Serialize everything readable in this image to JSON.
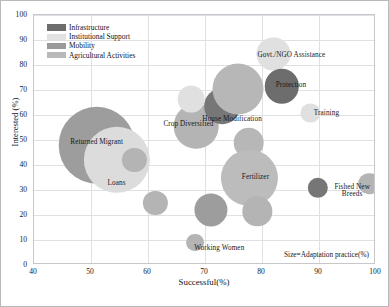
{
  "chart_data": {
    "type": "scatter",
    "title": "",
    "xlabel": "Successful(%)",
    "ylabel": "Interested (%)",
    "xlim": [
      40,
      100
    ],
    "ylim": [
      0,
      100
    ],
    "xticks": [
      40,
      50,
      60,
      70,
      80,
      90,
      100
    ],
    "yticks": [
      0,
      10,
      20,
      30,
      40,
      50,
      60,
      70,
      80,
      90,
      100
    ],
    "grid": true,
    "legend_position": "top-left",
    "size_note": "Size=Adaptation practice(%)",
    "size_encoding": "Size=Adaptation practice(%)",
    "legend": [
      {
        "label": "Infrastructure",
        "color": "#6d6d6d"
      },
      {
        "label": "Institutional Support",
        "color": "#e2e2e2"
      },
      {
        "label": "Mobility",
        "color": "#9a9a9a"
      },
      {
        "label": "Agricultural Activities",
        "color": "#b9b9b9"
      }
    ],
    "points": [
      {
        "label": "Returned Migrant",
        "x": 51.0,
        "y": 48.0,
        "size": 30.0,
        "category": "Mobility",
        "color": "#9d9d9d",
        "label_dx": 0,
        "label_dy": -2
      },
      {
        "label": "Loans",
        "x": 54.5,
        "y": 42.0,
        "size": 26.0,
        "category": "Institutional Support",
        "color": "#dcdcdc",
        "label_dx": 0,
        "label_dy": 24
      },
      {
        "label": "",
        "x": 57.6,
        "y": 42.0,
        "size": 9.5,
        "category": "Agricultural Activities",
        "color": "#b4b4b4",
        "label_dx": 0,
        "label_dy": 0
      },
      {
        "label": "",
        "x": 61.3,
        "y": 25.0,
        "size": 9.5,
        "category": "Agricultural Activities",
        "color": "#b4b4b4",
        "label_dx": 0,
        "label_dy": 0
      },
      {
        "label": "Crop Diversified",
        "x": 68.5,
        "y": 55.5,
        "size": 17.5,
        "category": "Agricultural Activities",
        "color": "#b4b4b4",
        "label_dx": -8,
        "label_dy": -1
      },
      {
        "label": "",
        "x": 67.5,
        "y": 66.5,
        "size": 10.5,
        "category": "Institutional Support",
        "color": "#e0e0e0",
        "label_dx": 0,
        "label_dy": 0
      },
      {
        "label": "House Modification",
        "x": 73.0,
        "y": 63.5,
        "size": 14.0,
        "category": "Infrastructure",
        "color": "#777777",
        "label_dx": 10,
        "label_dy": 14
      },
      {
        "label": "",
        "x": 75.8,
        "y": 70.5,
        "size": 20.0,
        "category": "Agricultural Activities",
        "color": "#b7b7b7",
        "label_dx": 0,
        "label_dy": 0
      },
      {
        "label": "Govt./NGO Assistance",
        "x": 82.0,
        "y": 84.5,
        "size": 13.0,
        "category": "Institutional Support",
        "color": "#e0e0e0",
        "label_dx": 18,
        "label_dy": 2
      },
      {
        "label": "Protection",
        "x": 83.5,
        "y": 71.5,
        "size": 13.5,
        "category": "Infrastructure",
        "color": "#6d6d6d",
        "label_dx": 9,
        "label_dy": 0
      },
      {
        "label": "Training",
        "x": 88.5,
        "y": 61.0,
        "size": 7.5,
        "category": "Institutional Support",
        "color": "#e0e0e0",
        "label_dx": 16,
        "label_dy": 1
      },
      {
        "label": "",
        "x": 77.7,
        "y": 49.0,
        "size": 12.0,
        "category": "Agricultural Activities",
        "color": "#b7b7b7",
        "label_dx": 0,
        "label_dy": 0
      },
      {
        "label": "Fertilizer",
        "x": 77.8,
        "y": 35.0,
        "size": 22.0,
        "category": "Agricultural Activities",
        "color": "#bcbcbc",
        "label_dx": 6,
        "label_dy": 0
      },
      {
        "label": "",
        "x": 79.2,
        "y": 21.5,
        "size": 11.5,
        "category": "Agricultural Activities",
        "color": "#b4b4b4",
        "label_dx": 0,
        "label_dy": 0
      },
      {
        "label": "",
        "x": 71.0,
        "y": 22.0,
        "size": 13.0,
        "category": "Mobility",
        "color": "#9d9d9d",
        "label_dx": 0,
        "label_dy": 0
      },
      {
        "label": "Working Women",
        "x": 68.3,
        "y": 9.0,
        "size": 7.0,
        "category": "Agricultural Activities",
        "color": "#b4b4b4",
        "label_dx": 24,
        "label_dy": 6
      },
      {
        "label": "",
        "x": 89.8,
        "y": 31.0,
        "size": 8.0,
        "category": "Infrastructure",
        "color": "#767676",
        "label_dx": 0,
        "label_dy": 0
      },
      {
        "label": "Fished New\nBreeds",
        "x": 98.8,
        "y": 32.5,
        "size": 8.5,
        "category": "Agricultural Activities",
        "color": "#b4b4b4",
        "label_dx": -17,
        "label_dy": 8
      }
    ]
  }
}
